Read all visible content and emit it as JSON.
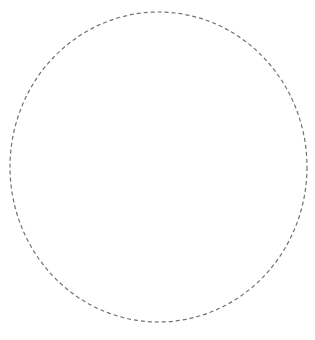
{
  "shape": {
    "type": "dashed-ellipse",
    "cx": 158.5,
    "cy": 167,
    "rx": 148.5,
    "ry": 155,
    "stroke": "#707070",
    "stroke_width": 1.2,
    "dasharray": "4 3",
    "fill": "none"
  },
  "background": "#ffffff"
}
